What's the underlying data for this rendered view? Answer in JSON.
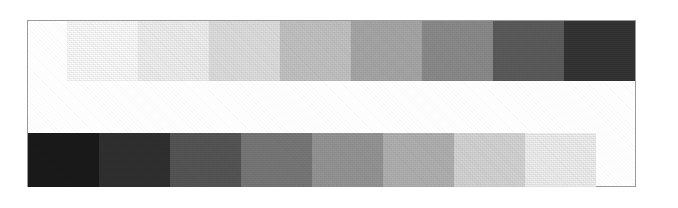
{
  "figure": {
    "caption": "",
    "background_color": "#ffffff",
    "frame_color": "#9a9a9a",
    "frame_background": "#ffffff"
  },
  "chart_data": {
    "type": "heatmap",
    "subtitle": "",
    "xlabel": "",
    "ylabel": "",
    "grid": false,
    "legend_position": "none",
    "patch_count_per_row": 8,
    "patch_width_px": 71,
    "axis_ranges": {
      "gray_level": [
        0,
        255
      ]
    },
    "series": [
      {
        "name": "Top strip (light to dark)",
        "row_index": 0,
        "direction": "light-to-dark",
        "categories": [
          "1",
          "2",
          "3",
          "4",
          "5",
          "6",
          "7",
          "8"
        ],
        "values": [
          252,
          241,
          224,
          196,
          168,
          140,
          92,
          52,
          22
        ],
        "swatches": [
          {
            "step": 1,
            "hex": "#fcfcfc",
            "gray_level": 252,
            "percent_black": 1
          },
          {
            "step": 2,
            "hex": "#f1f1f1",
            "gray_level": 241,
            "percent_black": 5
          },
          {
            "step": 3,
            "hex": "#e0e0e0",
            "gray_level": 224,
            "percent_black": 12
          },
          {
            "step": 4,
            "hex": "#c4c4c4",
            "gray_level": 196,
            "percent_black": 23
          },
          {
            "step": 5,
            "hex": "#a8a8a8",
            "gray_level": 168,
            "percent_black": 34
          },
          {
            "step": 6,
            "hex": "#8c8c8c",
            "gray_level": 140,
            "percent_black": 45
          },
          {
            "step": 7,
            "hex": "#5c5c5c",
            "gray_level": 92,
            "percent_black": 64
          },
          {
            "step": 8,
            "hex": "#343434",
            "gray_level": 52,
            "percent_black": 80
          },
          {
            "step": 9,
            "hex": "#161616",
            "gray_level": 22,
            "percent_black": 91
          }
        ]
      },
      {
        "name": "Bottom strip (dark to light)",
        "row_index": 1,
        "direction": "dark-to-light",
        "categories": [
          "1",
          "2",
          "3",
          "4",
          "5",
          "6",
          "7",
          "8"
        ],
        "values": [
          26,
          48,
          86,
          120,
          150,
          178,
          214,
          240
        ],
        "swatches": [
          {
            "step": 1,
            "hex": "#1a1a1a",
            "gray_level": 26,
            "percent_black": 90
          },
          {
            "step": 2,
            "hex": "#303030",
            "gray_level": 48,
            "percent_black": 81
          },
          {
            "step": 3,
            "hex": "#565656",
            "gray_level": 86,
            "percent_black": 66
          },
          {
            "step": 4,
            "hex": "#787878",
            "gray_level": 120,
            "percent_black": 53
          },
          {
            "step": 5,
            "hex": "#969696",
            "gray_level": 150,
            "percent_black": 41
          },
          {
            "step": 6,
            "hex": "#b2b2b2",
            "gray_level": 178,
            "percent_black": 30
          },
          {
            "step": 7,
            "hex": "#d6d6d6",
            "gray_level": 214,
            "percent_black": 16
          },
          {
            "step": 8,
            "hex": "#f0f0f0",
            "gray_level": 240,
            "percent_black": 6
          }
        ]
      }
    ]
  }
}
